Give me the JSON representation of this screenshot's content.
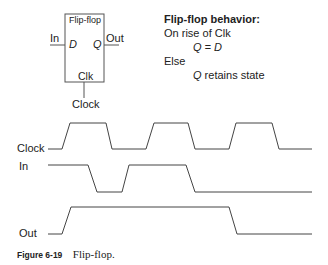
{
  "block": {
    "title": "Flip-flop",
    "input_port": "D",
    "output_port": "Q",
    "clock_port": "Clk",
    "input_wire": "In",
    "output_wire": "Out",
    "clock_wire": "Clock"
  },
  "behavior": {
    "heading": "Flip-flop behavior:",
    "line1": "On rise of Clk",
    "line2": "Q = D",
    "line3": "Else",
    "line4_q": "Q",
    "line4_rest": " retains state"
  },
  "timing": {
    "signals": [
      {
        "name": "Clock",
        "levels": "0 1 0 1 0 1 0"
      },
      {
        "name": "In",
        "levels": "1 0 1 0"
      },
      {
        "name": "Out",
        "levels": "0 1 0"
      }
    ],
    "stroke_color": "#444444"
  },
  "caption": {
    "figure": "Figure 6-19",
    "text": "Flip-flop."
  }
}
